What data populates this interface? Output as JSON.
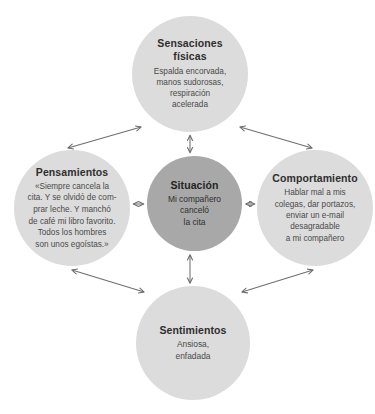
{
  "diagram": {
    "type": "cbt-five-areas-model",
    "colors": {
      "outer_node_fill": "#dcdcdc",
      "center_node_fill": "#a8a8a8",
      "arrow_stroke": "#6e6e6e",
      "text": "#3b3b3b",
      "background": "#ffffff"
    },
    "nodes": {
      "center": {
        "id": "situacion",
        "title": "Situación",
        "body": "Mi compañero\ncanceló\nla cita"
      },
      "top": {
        "id": "sensaciones-fisicas",
        "title": "Sensaciones físicas",
        "body": "Espalda encorvada,\nmanos sudorosas,\nrespiración\nacelerada"
      },
      "left": {
        "id": "pensamientos",
        "title": "Pensamientos",
        "body": "«Siempre cancela la\ncita. Y se olvidó de com-\nprar leche. Y manchó\nde café mi libro favorito.\nTodos los hombres\nson unos egoístas.»"
      },
      "right": {
        "id": "comportamiento",
        "title": "Comportamiento",
        "body": "Hablar mal a mis\ncolegas, dar portazos,\nenviar un e-mail\ndesagradable\na mi compañero"
      },
      "bottom": {
        "id": "sentimientos",
        "title": "Sentimientos",
        "body": "Ansiosa,\nenfadada"
      }
    },
    "connectors": [
      {
        "id": "center-top",
        "from": "situacion",
        "to": "sensaciones-fisicas",
        "style": "double-headed"
      },
      {
        "id": "center-left",
        "from": "situacion",
        "to": "pensamientos",
        "style": "double-headed"
      },
      {
        "id": "center-right",
        "from": "situacion",
        "to": "comportamiento",
        "style": "double-headed"
      },
      {
        "id": "center-bottom",
        "from": "situacion",
        "to": "sentimientos",
        "style": "double-headed"
      },
      {
        "id": "top-left",
        "from": "sensaciones-fisicas",
        "to": "pensamientos",
        "style": "double-headed"
      },
      {
        "id": "top-right",
        "from": "sensaciones-fisicas",
        "to": "comportamiento",
        "style": "double-headed"
      },
      {
        "id": "bottom-left",
        "from": "sentimientos",
        "to": "pensamientos",
        "style": "double-headed"
      },
      {
        "id": "bottom-right",
        "from": "sentimientos",
        "to": "comportamiento",
        "style": "double-headed"
      }
    ]
  }
}
